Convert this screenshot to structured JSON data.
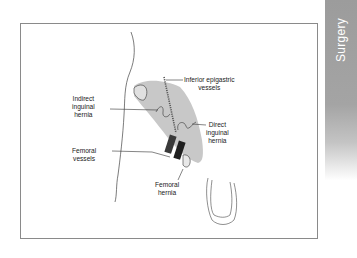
{
  "side_tab": {
    "label": "Surgery",
    "color": "#a0a0a0"
  },
  "diagram": {
    "labels": {
      "inferior_epigastric": [
        "Inferior epigastric",
        "vessels"
      ],
      "indirect": [
        "Indirect",
        "inguinal",
        "hernia"
      ],
      "direct": [
        "Direct",
        "inguinal",
        "hernia"
      ],
      "femoral_vessels": [
        "Femoral",
        "vessels"
      ],
      "femoral_hernia": [
        "Femoral",
        "hernia"
      ]
    },
    "colors": {
      "shaded_region": "#c8c8c8",
      "line": "#333333",
      "vessel": "#2a2a2a"
    }
  }
}
